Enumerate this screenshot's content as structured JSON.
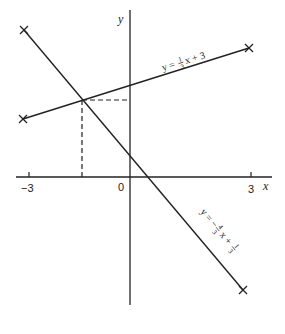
{
  "axes": {
    "x_label": "x",
    "y_label": "y",
    "origin_label": "0",
    "x_ticks": [
      {
        "value": -3,
        "label": "−3"
      },
      {
        "value": 3,
        "label": "3"
      }
    ]
  },
  "lines": [
    {
      "name": "line-one-third",
      "equation": "y = 1/3 x + 3",
      "label_parts": {
        "lhs": "y =",
        "num": "1",
        "den": "3",
        "rest": "x + 3"
      },
      "slope": 0.3333,
      "intercept": 3
    },
    {
      "name": "line-minus-four-thirds",
      "equation": "y = -4/3 x + 1/3",
      "label_parts": {
        "lhs": "y = −",
        "num1": "4",
        "den1": "3",
        "mid": "x +",
        "num2": "1",
        "den2": "3"
      },
      "slope": -1.3333,
      "intercept": 0.3333
    }
  ],
  "intersection": {
    "x": -1.6,
    "y": 2.47,
    "guides": "dashed"
  },
  "colors": {
    "ink": "#222222",
    "background": "#ffffff"
  }
}
